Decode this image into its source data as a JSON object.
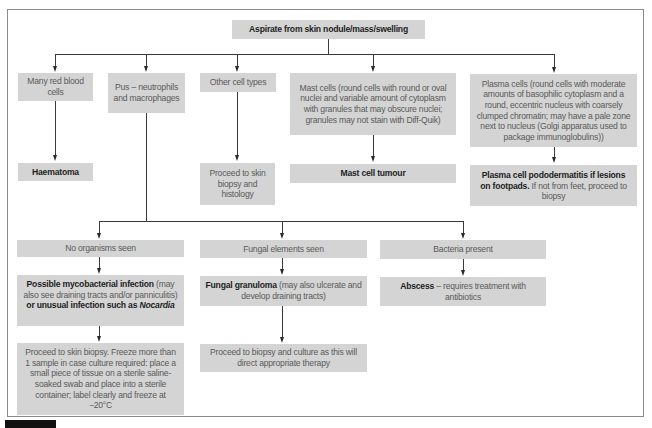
{
  "diagram": {
    "root": {
      "label": "Aspirate from skin nodule/mass/swelling"
    },
    "branches": [
      {
        "id": "rbc",
        "label": "Many red blood cells",
        "outcome": {
          "bold": "Haematoma",
          "rest": ""
        }
      },
      {
        "id": "pus",
        "label": "Pus – neutrophils and macrophages",
        "sub_branches": [
          {
            "label": "No organisms seen",
            "outcome": {
              "bold1": "Possible mycobacterial infection",
              "text1": " (may also see draining tracts and/or panniculitis) ",
              "bold2": "or unusual infection such as ",
              "italic": "Nocardia"
            },
            "next": "Proceed to skin biopsy. Freeze more than 1 sample in case culture required: place a small piece of tissue on a sterile saline-soaked swab and place into a sterile container; label clearly and freeze at −20°C"
          },
          {
            "label": "Fungal elements seen",
            "outcome": {
              "bold": "Fungal granuloma",
              "rest": " (may also ulcerate and develop draining tracts)"
            },
            "next": "Proceed to biopsy and culture as this will direct appropriate therapy"
          },
          {
            "label": "Bacteria present",
            "outcome": {
              "bold": "Abscess",
              "rest": " – requires treatment with antibiotics"
            }
          }
        ]
      },
      {
        "id": "other",
        "label": "Other cell types",
        "outcome": {
          "text": "Proceed to skin biopsy and histology"
        }
      },
      {
        "id": "mast",
        "label": "Mast cells (round cells with round or oval nuclei and variable amount of cytoplasm with granules that may obscure nuclei; granules may not stain with Diff-Quik)",
        "outcome": {
          "bold": "Mast cell tumour",
          "rest": ""
        }
      },
      {
        "id": "plasma",
        "label": "Plasma cells (round cells with moderate amounts of basophilic cytoplasm and a round, eccentric nucleus with coarsely clumped chromatin; may have a pale zone next to nucleus (Golgi apparatus used to package immunoglobulins))",
        "outcome": {
          "bold": "Plasma cell pododermatitis if lesions on footpads.",
          "rest": " If not from feet, proceed to biopsy"
        }
      }
    ]
  },
  "colors": {
    "box_fill": "#d4d4d4",
    "line": "#3a3a3a",
    "frame": "#8a8a8a",
    "bold_text": "#1e1e1e",
    "text": "#5a5a5a"
  }
}
